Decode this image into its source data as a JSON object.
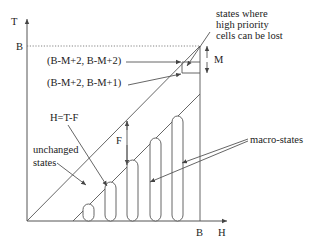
{
  "diagram": {
    "axes": {
      "y_label": "T",
      "x_label": "H",
      "y_tick": "B",
      "x_tick": "B"
    },
    "labels": {
      "state_upper": "(B-M+2, B-M+2)",
      "state_lower": "(B-M+2,  B-M+1)",
      "h_eq": "H=T-F",
      "unchanged_line1": "unchanged",
      "unchanged_line2": "states",
      "lost_line1": "states where",
      "lost_line2": "high priority",
      "lost_line3": "cells can be lost",
      "m_dim": "M",
      "f_dim": "F",
      "macro": "macro-states"
    },
    "macro_state_count": 5
  }
}
